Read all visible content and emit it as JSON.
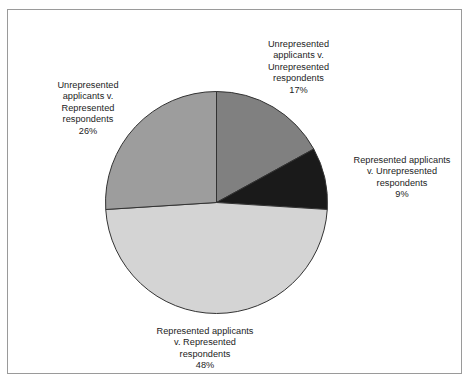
{
  "figure": {
    "background_color": "#ffffff",
    "border_color": "#9a9a9a"
  },
  "chart_data": {
    "type": "pie",
    "title": "",
    "subtitle": "",
    "xlabel": "",
    "ylabel": "",
    "legend_position": "none",
    "grid": false,
    "start_angle_deg": 0,
    "direction": "clockwise",
    "categories": [
      "Unrepresented applicants v. Unrepresented respondents",
      "Represented applicants v. Unrepresented respondents",
      "Represented applicants v. Represented respondents",
      "Unrepresented applicants v. Represented respondents"
    ],
    "values": [
      17,
      9,
      48,
      26
    ],
    "value_unit": "%",
    "colors": [
      "#808080",
      "#1a1a1a",
      "#d4d4d4",
      "#9d9d9d"
    ],
    "slice_edge_color": "#333333",
    "slices": [
      {
        "label": "Unrepresented applicants v. Unrepresented respondents",
        "value": 17,
        "display_value": "17%",
        "color": "#808080",
        "start_deg": 0,
        "end_deg": 61.2
      },
      {
        "label": "Represented applicants v. Unrepresented respondents",
        "value": 9,
        "display_value": "9%",
        "color": "#1a1a1a",
        "start_deg": 61.2,
        "end_deg": 93.6
      },
      {
        "label": "Represented applicants v. Represented respondents",
        "value": 48,
        "display_value": "48%",
        "color": "#d4d4d4",
        "start_deg": 93.6,
        "end_deg": 266.4
      },
      {
        "label": "Unrepresented applicants v. Represented respondents",
        "value": 26,
        "display_value": "26%",
        "color": "#9d9d9d",
        "start_deg": 266.4,
        "end_deg": 360
      }
    ]
  },
  "labels": {
    "top": {
      "text": "Unrepresented\napplicants v.\nUnrepresented\nrespondents",
      "percent": "17%"
    },
    "right": {
      "text": "Represented applicants\nv. Unrepresented\nrespondents",
      "percent": "9%"
    },
    "left": {
      "text": "Unrepresented\napplicants v.\nRepresented\nrespondents",
      "percent": "26%"
    },
    "bottom": {
      "text": "Represented applicants\nv. Represented\nrespondents",
      "percent": "48%"
    }
  }
}
